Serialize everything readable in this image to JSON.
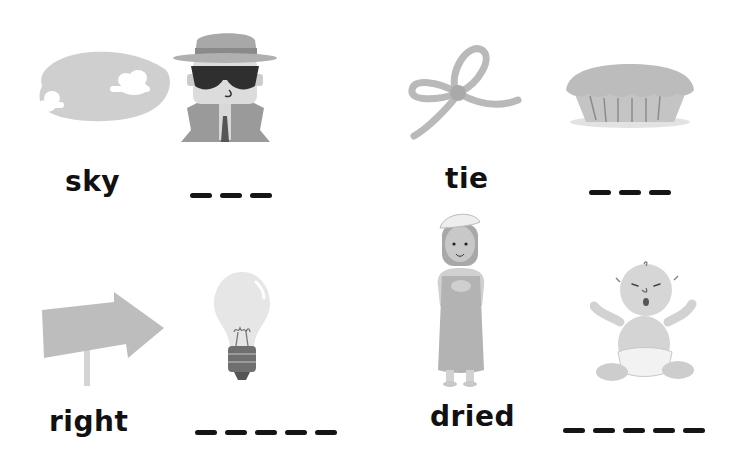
{
  "worksheet": {
    "items": [
      {
        "word": "sky",
        "picture_1": "sky-with-clouds",
        "picture_2": "spy-with-hat-and-sunglasses",
        "blank_count": 3
      },
      {
        "word": "tie",
        "picture_1": "tied-rope-bow",
        "picture_2": "pie",
        "blank_count": 3
      },
      {
        "word": "right",
        "picture_1": "right-arrow-sign",
        "picture_2": "light-bulb",
        "blank_count": 5
      },
      {
        "word": "dried",
        "picture_1": "woman-in-towel",
        "picture_2": "crying-baby",
        "blank_count": 5
      }
    ]
  },
  "colors": {
    "background": "#ffffff",
    "text": "#111111",
    "illustration_gray": "#bdbdbd",
    "illustration_dark": "#3a3a3a"
  }
}
